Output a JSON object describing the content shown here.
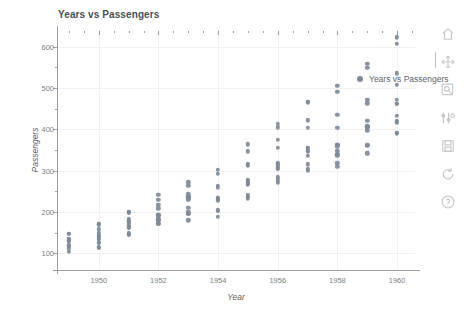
{
  "chart_data": {
    "type": "scatter",
    "title": "Years vs Passengers",
    "xlabel": "Year",
    "ylabel": "Passengers",
    "xlim": [
      1948.6,
      1960.6
    ],
    "ylim": [
      60,
      640
    ],
    "xticks": [
      1950,
      1952,
      1954,
      1956,
      1958,
      1960
    ],
    "xtick_labels": [
      "1950",
      "1952",
      "1954",
      "1956",
      "1958",
      "1960"
    ],
    "xticks_minor": [
      1949,
      1951,
      1953,
      1955,
      1957,
      1959
    ],
    "yticks": [
      100,
      200,
      300,
      400,
      500,
      600
    ],
    "ytick_labels": [
      "100",
      "200",
      "300",
      "400",
      "500",
      "600"
    ],
    "yticks_minor": [
      150,
      250,
      350,
      450,
      550
    ],
    "grid": true,
    "legend": {
      "position": "upper right",
      "entries": [
        {
          "name": "Years vs Passengers",
          "marker": "circle",
          "color": "#7f8a99"
        }
      ]
    },
    "series": [
      {
        "name": "Years vs Passengers",
        "color": "#7f8a99",
        "marker": "circle",
        "x": [
          1949,
          1949,
          1949,
          1949,
          1949,
          1949,
          1949,
          1949,
          1949,
          1949,
          1949,
          1949,
          1950,
          1950,
          1950,
          1950,
          1950,
          1950,
          1950,
          1950,
          1950,
          1950,
          1950,
          1950,
          1951,
          1951,
          1951,
          1951,
          1951,
          1951,
          1951,
          1951,
          1951,
          1951,
          1951,
          1951,
          1952,
          1952,
          1952,
          1952,
          1952,
          1952,
          1952,
          1952,
          1952,
          1952,
          1952,
          1952,
          1953,
          1953,
          1953,
          1953,
          1953,
          1953,
          1953,
          1953,
          1953,
          1953,
          1953,
          1953,
          1954,
          1954,
          1954,
          1954,
          1954,
          1954,
          1954,
          1954,
          1954,
          1954,
          1954,
          1954,
          1955,
          1955,
          1955,
          1955,
          1955,
          1955,
          1955,
          1955,
          1955,
          1955,
          1955,
          1955,
          1956,
          1956,
          1956,
          1956,
          1956,
          1956,
          1956,
          1956,
          1956,
          1956,
          1956,
          1956,
          1957,
          1957,
          1957,
          1957,
          1957,
          1957,
          1957,
          1957,
          1957,
          1957,
          1957,
          1957,
          1958,
          1958,
          1958,
          1958,
          1958,
          1958,
          1958,
          1958,
          1958,
          1958,
          1958,
          1958,
          1959,
          1959,
          1959,
          1959,
          1959,
          1959,
          1959,
          1959,
          1959,
          1959,
          1959,
          1959,
          1960,
          1960,
          1960,
          1960,
          1960,
          1960,
          1960,
          1960,
          1960,
          1960,
          1960,
          1960
        ],
        "y": [
          112,
          118,
          132,
          129,
          121,
          135,
          148,
          148,
          136,
          119,
          104,
          118,
          115,
          126,
          141,
          135,
          125,
          149,
          170,
          170,
          158,
          133,
          114,
          140,
          145,
          150,
          178,
          163,
          172,
          178,
          199,
          199,
          184,
          162,
          146,
          166,
          171,
          180,
          193,
          181,
          183,
          218,
          230,
          242,
          209,
          191,
          172,
          194,
          196,
          196,
          236,
          235,
          229,
          243,
          264,
          272,
          237,
          211,
          180,
          201,
          204,
          188,
          235,
          227,
          234,
          264,
          302,
          293,
          259,
          229,
          203,
          229,
          242,
          233,
          267,
          269,
          270,
          315,
          364,
          347,
          312,
          274,
          237,
          278,
          284,
          277,
          317,
          313,
          318,
          374,
          413,
          405,
          355,
          306,
          271,
          306,
          315,
          301,
          356,
          348,
          355,
          422,
          465,
          467,
          404,
          347,
          305,
          336,
          340,
          318,
          362,
          348,
          363,
          435,
          491,
          505,
          404,
          359,
          310,
          337,
          360,
          342,
          406,
          396,
          420,
          472,
          548,
          559,
          463,
          407,
          362,
          405,
          417,
          391,
          419,
          461,
          472,
          535,
          622,
          606,
          508,
          461,
          390,
          432
        ]
      }
    ]
  },
  "toolbar": {
    "items": [
      {
        "name": "home-icon",
        "label": "Reset original view"
      },
      {
        "name": "move-icon",
        "label": "Pan axes"
      },
      {
        "name": "zoom-icon",
        "label": "Zoom to rectangle"
      },
      {
        "name": "configure-subplots-icon",
        "label": "Configure subplots"
      },
      {
        "name": "save-icon",
        "label": "Save the figure"
      },
      {
        "name": "refresh-icon",
        "label": "Refresh"
      },
      {
        "name": "help-icon",
        "label": "Help"
      }
    ]
  },
  "theme": {
    "marker_color": "#7f8a99",
    "axis_color": "#9aa0a6",
    "grid_color": "#f0f1f3",
    "text_color": "#5c6166",
    "background": "#ffffff"
  }
}
